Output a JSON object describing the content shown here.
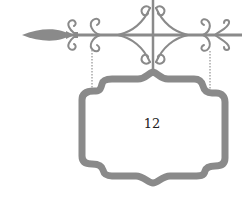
{
  "sign": {
    "label": "12"
  },
  "colors": {
    "iron": "#8a8a8a",
    "iron_dark": "#7a7a7a",
    "text": "#222222",
    "background": "#ffffff"
  },
  "icons": {
    "bracket": "wrought-iron-bracket-icon",
    "chain": "chain-icon",
    "frame": "ornate-sign-frame-icon"
  }
}
